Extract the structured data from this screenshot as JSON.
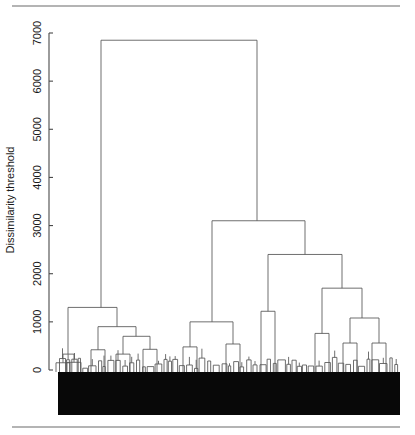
{
  "figure": {
    "width": 415,
    "height": 435,
    "background": "#ffffff",
    "top_rule": {
      "x1": 12,
      "x2": 400,
      "y": 6,
      "color": "#6b6b6b"
    },
    "bottom_rule": {
      "x1": 12,
      "x2": 400,
      "y": 427,
      "color": "#6b6b6b"
    }
  },
  "axis": {
    "title": "Dissimilarity threshold",
    "title_x": 14,
    "title_y": 200,
    "tick_labels": [
      "0",
      "1000",
      "2000",
      "3000",
      "4000",
      "5000",
      "6000",
      "7000"
    ],
    "tick_values": [
      0,
      1000,
      2000,
      3000,
      4000,
      5000,
      6000,
      7000
    ],
    "line_x": 49,
    "label_x": 44,
    "tick_len": 4,
    "color": "#4a4a4a"
  },
  "chart_data": {
    "type": "dendrogram",
    "title": "",
    "xlabel": "",
    "ylabel": "Dissimilarity threshold",
    "ylim": [
      0,
      7000
    ],
    "y_pixel_zero": 370,
    "y_pixel_max": 33,
    "x_range_px": [
      58,
      400
    ],
    "grid": false,
    "legend": null,
    "leaf_mass": {
      "description": "dense unreadable black block of terminal leaf labels",
      "x": 58,
      "y_top": 372,
      "width": 342,
      "height": 43,
      "color": "#080808"
    },
    "note": "Merge heights read off the y-axis in dissimilarity units. Node = {x_px, height}; children link left/right.",
    "nodes": [
      {
        "id": "root",
        "x": 179,
        "height": 6850,
        "left": "L",
        "right": "R"
      },
      {
        "id": "L",
        "x": 101,
        "height": 1300,
        "left": "L1",
        "right": "L2"
      },
      {
        "id": "L1",
        "x": 68,
        "height": 330,
        "left": "L1a",
        "right": "L1b"
      },
      {
        "id": "L1a",
        "x": 63,
        "height": 150,
        "left": null,
        "right": null
      },
      {
        "id": "L1b",
        "x": 74,
        "height": 160,
        "left": null,
        "right": null
      },
      {
        "id": "L2",
        "x": 117,
        "height": 900,
        "left": "L2a",
        "right": "L2b"
      },
      {
        "id": "L2a",
        "x": 98,
        "height": 420,
        "left": null,
        "right": null
      },
      {
        "id": "L2b",
        "x": 136,
        "height": 700,
        "left": "L2b1",
        "right": "L2b2"
      },
      {
        "id": "L2b1",
        "x": 123,
        "height": 330,
        "left": null,
        "right": null
      },
      {
        "id": "L2b2",
        "x": 150,
        "height": 430,
        "left": null,
        "right": null
      },
      {
        "id": "R",
        "x": 257,
        "height": 3100,
        "left": "R1",
        "right": "R2"
      },
      {
        "id": "R1",
        "x": 212,
        "height": 1000,
        "left": "R1a",
        "right": "R1b"
      },
      {
        "id": "R1a",
        "x": 190,
        "height": 480,
        "left": null,
        "right": null
      },
      {
        "id": "R1b",
        "x": 233,
        "height": 540,
        "left": null,
        "right": null
      },
      {
        "id": "R2",
        "x": 305,
        "height": 2400,
        "left": "R2a",
        "right": "R2b"
      },
      {
        "id": "R2a",
        "x": 268,
        "height": 1220,
        "left": null,
        "right": null
      },
      {
        "id": "R2b",
        "x": 342,
        "height": 1700,
        "left": "R2b1",
        "right": "R2b2"
      },
      {
        "id": "R2b1",
        "x": 322,
        "height": 760,
        "left": null,
        "right": null
      },
      {
        "id": "R2b2",
        "x": 362,
        "height": 1080,
        "left": "R2b2a",
        "right": "R2b2b"
      },
      {
        "id": "R2b2a",
        "x": 350,
        "height": 560,
        "left": null,
        "right": null
      },
      {
        "id": "R2b2b",
        "x": 379,
        "height": 560,
        "left": null,
        "right": null
      }
    ]
  }
}
